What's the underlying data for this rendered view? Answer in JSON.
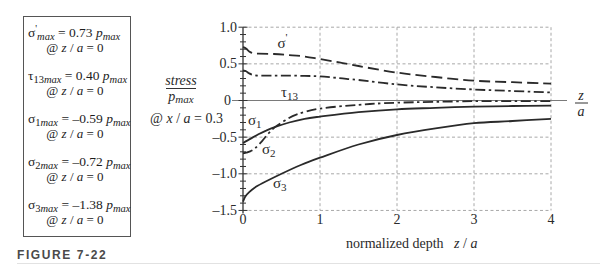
{
  "figure": {
    "label": "FIGURE 7-22"
  },
  "summary_box": {
    "items": [
      {
        "symbol": "σ",
        "sup": "'",
        "sub_index": "",
        "sub": "max",
        "value": "= 0.73",
        "p": "p",
        "p_sub": "max",
        "condition_parts": [
          "@ ",
          "z",
          " / ",
          "a",
          " = 0"
        ]
      },
      {
        "symbol": "τ",
        "sup": "",
        "sub_index": "13",
        "sub": "max",
        "value": "= 0.40",
        "p": "p",
        "p_sub": "max",
        "condition_parts": [
          "@ ",
          "z",
          " / ",
          "a",
          " = 0"
        ]
      },
      {
        "symbol": "σ",
        "sup": "",
        "sub_index": "1",
        "sub": "max",
        "value": "= –0.59",
        "p": "p",
        "p_sub": "max",
        "condition_parts": [
          "@ ",
          "z",
          " / ",
          "a",
          " = 0"
        ]
      },
      {
        "symbol": "σ",
        "sup": "",
        "sub_index": "2",
        "sub": "max",
        "value": "= –0.72",
        "p": "p",
        "p_sub": "max",
        "condition_parts": [
          "@ ",
          "z",
          " / ",
          "a",
          " = 0"
        ]
      },
      {
        "symbol": "σ",
        "sup": "",
        "sub_index": "3",
        "sub": "max",
        "value": "= –1.38",
        "p": "p",
        "p_sub": "max",
        "condition_parts": [
          "@ ",
          "z",
          " / ",
          "a",
          " = 0"
        ]
      }
    ]
  },
  "chart_data": {
    "type": "line",
    "title": "",
    "xlabel": "normalized depth z / a",
    "xlabel_parts": [
      "normalized depth   ",
      "z",
      " / ",
      "a"
    ],
    "ylabel": "stress / p_max",
    "ylabel_numerator": "stress",
    "ylabel_denominator": {
      "symbol": "p",
      "sub": "max"
    },
    "ylabel_note": "@ x / a = 0.3",
    "ylabel_note_parts": [
      "@ ",
      "x",
      " / ",
      "a",
      " = 0.3"
    ],
    "axis_end_label": {
      "numerator": "z",
      "denominator": "a"
    },
    "xlim": [
      0,
      4
    ],
    "ylim": [
      -1.5,
      1.0
    ],
    "xticks": [
      0,
      1,
      2,
      3,
      4
    ],
    "xtick_labels": [
      "0",
      "1",
      "2",
      "3",
      "4"
    ],
    "yticks": [
      1.0,
      0.5,
      0,
      -0.5,
      -1.0,
      -1.5
    ],
    "ytick_labels": [
      "1.0",
      "0.5",
      "0",
      "–0.5",
      "–1.0",
      "–1.5"
    ],
    "grid": true,
    "legend": "inline curve labels",
    "series": [
      {
        "name": "σ'",
        "symbol": "σ",
        "sup": "'",
        "sub": "",
        "style": "dashed",
        "label_pos": [
          0.448,
          0.784
        ],
        "x": [
          0,
          0.04,
          0.08,
          0.13,
          0.2,
          0.4,
          0.6,
          0.8,
          1.0,
          1.25,
          1.5,
          2.0,
          2.5,
          3.0,
          3.5,
          4.0
        ],
        "y": [
          0.73,
          0.71,
          0.67,
          0.645,
          0.64,
          0.635,
          0.62,
          0.6,
          0.565,
          0.52,
          0.47,
          0.38,
          0.32,
          0.27,
          0.25,
          0.23
        ]
      },
      {
        "name": "τ13",
        "symbol": "τ",
        "sup": "",
        "sub": "13",
        "style": "dashdot",
        "label_pos": [
          0.494,
          0.116
        ],
        "x": [
          0,
          0.04,
          0.08,
          0.13,
          0.2,
          0.4,
          0.6,
          0.8,
          1.0,
          1.25,
          1.5,
          2.0,
          2.5,
          3.0,
          3.5,
          4.0
        ],
        "y": [
          0.41,
          0.4,
          0.37,
          0.35,
          0.34,
          0.34,
          0.34,
          0.335,
          0.33,
          0.305,
          0.28,
          0.22,
          0.18,
          0.15,
          0.13,
          0.11
        ]
      },
      {
        "name": "σ1",
        "symbol": "σ",
        "sup": "",
        "sub": "1",
        "style": "solid",
        "label_pos": [
          0.065,
          -0.266
        ],
        "x": [
          0,
          0.1,
          0.2,
          0.3,
          0.42,
          0.6,
          0.8,
          1.0,
          1.5,
          2.0,
          2.5,
          3.0,
          3.5,
          4.0
        ],
        "y": [
          -0.58,
          -0.52,
          -0.46,
          -0.41,
          -0.36,
          -0.3,
          -0.25,
          -0.22,
          -0.16,
          -0.12,
          -0.1,
          -0.085,
          -0.075,
          -0.07
        ]
      },
      {
        "name": "σ2",
        "symbol": "σ",
        "sup": "",
        "sub": "2",
        "style": "dashdot",
        "label_pos": [
          0.247,
          -0.666
        ],
        "x": [
          0,
          0.05,
          0.1,
          0.16,
          0.25,
          0.33,
          0.42,
          0.55,
          0.7,
          1.0,
          1.5,
          2.0,
          3.0,
          4.0
        ],
        "y": [
          -0.72,
          -0.71,
          -0.69,
          -0.65,
          -0.55,
          -0.45,
          -0.36,
          -0.27,
          -0.19,
          -0.11,
          -0.06,
          -0.03,
          -0.01,
          -0.01
        ]
      },
      {
        "name": "σ3",
        "symbol": "σ",
        "sup": "",
        "sub": "3",
        "style": "solid",
        "label_pos": [
          0.39,
          -1.12
        ],
        "x": [
          0,
          0.03,
          0.08,
          0.15,
          0.25,
          0.5,
          0.75,
          1.0,
          1.5,
          2.0,
          2.5,
          3.0,
          3.5,
          4.0
        ],
        "y": [
          -1.38,
          -1.31,
          -1.25,
          -1.19,
          -1.13,
          -1.0,
          -0.88,
          -0.78,
          -0.6,
          -0.47,
          -0.38,
          -0.31,
          -0.28,
          -0.25
        ]
      }
    ]
  }
}
